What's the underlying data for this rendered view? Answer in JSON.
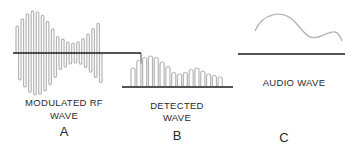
{
  "panels": [
    {
      "id": "A",
      "caption_line1": "MODULATED RF",
      "caption_line2": "WAVE",
      "letter": "A"
    },
    {
      "id": "B",
      "caption_line1": "DETECTED",
      "caption_line2": "WAVE",
      "letter": "B"
    },
    {
      "id": "C",
      "caption_line1": "AUDIO WAVE",
      "letter": "C"
    }
  ],
  "colors": {
    "wave": "#b5b5b5",
    "axis": "#1a1a1a",
    "text": "#2a2a2a"
  }
}
